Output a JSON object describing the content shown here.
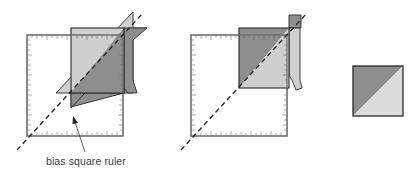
{
  "diagram": {
    "colors": {
      "dark_gray": "#8e8e8e",
      "light_gray": "#cfcfcf",
      "ruler_line": "#6e6e6e",
      "outline": "#2a2a2a",
      "dashed": "#222222"
    },
    "panels": [
      {
        "id": "step-1",
        "description": "Bias square ruler placed on pieced square with diagonal on seam"
      },
      {
        "id": "step-2",
        "description": "Trimming the pieced square along ruler edges"
      },
      {
        "id": "step-3",
        "description": "Finished half-square triangle unit"
      }
    ],
    "labels": {
      "ruler_callout": "bias square ruler"
    }
  }
}
